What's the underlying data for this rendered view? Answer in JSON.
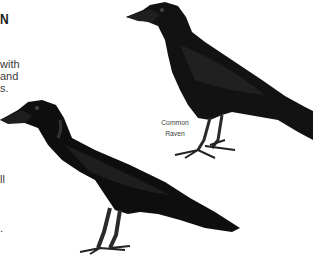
{
  "page": {
    "heading_fragment": "N",
    "paragraph_fragments": [
      "with",
      "and",
      "s."
    ],
    "lower_fragments": [
      "ll",
      "."
    ]
  },
  "illustrations": [
    {
      "name": "Common Raven",
      "label_lines": [
        "Common",
        "Raven"
      ],
      "color": "#111111"
    },
    {
      "name": "crow",
      "label_lines": [],
      "color": "#0d0d0d"
    }
  ]
}
